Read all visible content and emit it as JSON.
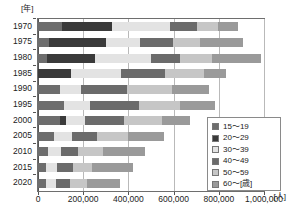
{
  "chart_data": {
    "type": "bar",
    "orientation": "horizontal",
    "stacked": true,
    "title": "",
    "xlabel": "[人]",
    "ylabel": "[年]",
    "xlim": [
      0,
      1000000
    ],
    "grid": true,
    "legend_position": "inside-bottom-right",
    "categories": [
      "1970",
      "1975",
      "1980",
      "1985",
      "1990",
      "1995",
      "2000",
      "2005",
      "2010",
      "2015",
      "2020"
    ],
    "xticks": [
      0,
      200000,
      400000,
      600000,
      800000,
      1000000
    ],
    "xtick_labels": [
      "0",
      "200,000",
      "400,000",
      "600,000",
      "800,000",
      "1,000,000"
    ],
    "series": [
      {
        "name": "15～19",
        "color": "#6d6d6d",
        "values": [
          100000,
          45000,
          35000,
          0,
          95000,
          110000,
          95000,
          65000,
          40000,
          30000,
          30000
        ]
      },
      {
        "name": "20～29",
        "color": "#3a3a3a",
        "values": [
          220000,
          245000,
          210000,
          140000,
          0,
          0,
          20000,
          0,
          0,
          0,
          0
        ]
      },
      {
        "name": "30～39",
        "color": "#e3e3e3",
        "values": [
          250000,
          150000,
          240000,
          220000,
          85000,
          110000,
          80000,
          75000,
          55000,
          45000,
          40000
        ]
      },
      {
        "name": "40～49",
        "color": "#6b6b6b",
        "values": [
          115000,
          140000,
          125000,
          190000,
          200000,
          215000,
          170000,
          110000,
          70000,
          65000,
          60000
        ]
      },
      {
        "name": "50～59",
        "color": "#c6c6c6",
        "values": [
          90000,
          115000,
          140000,
          165000,
          195000,
          175000,
          160000,
          130000,
          105000,
          80000,
          70000
        ]
      },
      {
        "name": "60～[歳]",
        "color": "#9a9a9a",
        "values": [
          85000,
          185000,
          210000,
          95000,
          160000,
          150000,
          120000,
          155000,
          180000,
          180000,
          140000
        ]
      }
    ],
    "totals": [
      860000,
      880000,
      960000,
      810000,
      735000,
      760000,
      645000,
      535000,
      450000,
      400000,
      340000
    ]
  },
  "legend": {
    "items": [
      {
        "label": "15～19",
        "color": "#6d6d6d",
        "swatch_name": "legend-swatch-15-19"
      },
      {
        "label": "20～29",
        "color": "#3a3a3a",
        "swatch_name": "legend-swatch-20-29"
      },
      {
        "label": "30～39",
        "color": "#e3e3e3",
        "swatch_name": "legend-swatch-30-39"
      },
      {
        "label": "40～49",
        "color": "#6b6b6b",
        "swatch_name": "legend-swatch-40-49"
      },
      {
        "label": "50～59",
        "color": "#c6c6c6",
        "swatch_name": "legend-swatch-50-59"
      },
      {
        "label": "60～[歳]",
        "color": "#9a9a9a",
        "swatch_name": "legend-swatch-60-plus"
      }
    ]
  },
  "axes": {
    "y_unit": "[年]",
    "x_unit": "[人]"
  }
}
